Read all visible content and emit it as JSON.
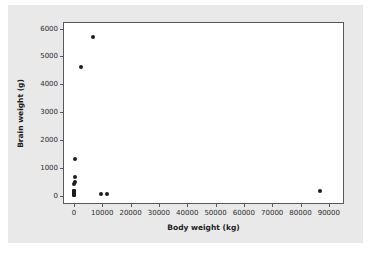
{
  "chart_data": {
    "type": "scatter",
    "title": "",
    "xlabel": "Body weight (kg)",
    "ylabel": "Brain weight (g)",
    "xlim": [
      -3500,
      95000
    ],
    "ylim": [
      -260,
      6200
    ],
    "xticks": [
      0,
      10000,
      20000,
      30000,
      40000,
      50000,
      60000,
      70000,
      80000,
      90000
    ],
    "xticklabels": [
      "0",
      "10000",
      "20000",
      "30000",
      "40000",
      "50000",
      "60000",
      "70000",
      "80000",
      "90000"
    ],
    "yticks": [
      0,
      1000,
      2000,
      3000,
      4000,
      5000,
      6000
    ],
    "yticklabels": [
      "0",
      "1000",
      "2000",
      "3000",
      "4000",
      "5000",
      "6000"
    ],
    "grid": false,
    "legend": false,
    "marker": "filled-circle",
    "marker_color": "#1d1d1f",
    "points": [
      {
        "x": 6654,
        "y": 5712
      },
      {
        "x": 2547,
        "y": 4603
      },
      {
        "x": 521,
        "y": 1320
      },
      {
        "x": 465,
        "y": 680
      },
      {
        "x": 187,
        "y": 419
      },
      {
        "x": 250,
        "y": 490
      },
      {
        "x": 192,
        "y": 180
      },
      {
        "x": 160,
        "y": 169
      },
      {
        "x": 120,
        "y": 115
      },
      {
        "x": 100,
        "y": 157
      },
      {
        "x": 80,
        "y": 60
      },
      {
        "x": 60,
        "y": 35
      },
      {
        "x": 55,
        "y": 100
      },
      {
        "x": 36,
        "y": 120
      },
      {
        "x": 28,
        "y": 115
      },
      {
        "x": 10,
        "y": 50
      },
      {
        "x": 3,
        "y": 25
      },
      {
        "x": 1,
        "y": 10
      },
      {
        "x": 9400,
        "y": 70
      },
      {
        "x": 11700,
        "y": 50
      },
      {
        "x": 87000,
        "y": 155
      }
    ]
  },
  "figure": {
    "background_color": "#e9e9e9",
    "panel_color": "#ffffff",
    "axis_color": "#58585a"
  }
}
